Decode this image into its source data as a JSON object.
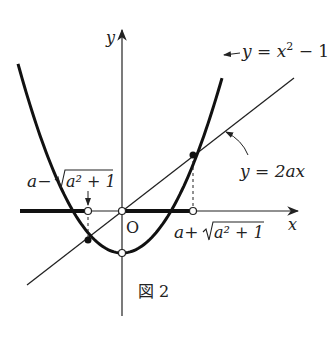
{
  "figure": {
    "caption": "図 2",
    "axes": {
      "x_label": "x",
      "y_label": "y",
      "origin_label": "O"
    },
    "curves": [
      {
        "name": "parabola",
        "equation": "y = x² − 1",
        "label_main": "y = x",
        "label_sup": "2",
        "label_tail": " − 1"
      },
      {
        "name": "line",
        "equation": "y = 2ax",
        "label": "y = 2ax"
      }
    ],
    "points": {
      "left_root_label_a": "a−",
      "left_root_label_sqrt": "a² + 1",
      "right_root_label_a": "a+",
      "right_root_label_sqrt": "a² + 1"
    },
    "parameters": {
      "a": 0.5
    },
    "solution_set": "x ≤ a−√(a²+1), 0 ≤ x ≤ a+√(a²+1) (thick segments)"
  }
}
